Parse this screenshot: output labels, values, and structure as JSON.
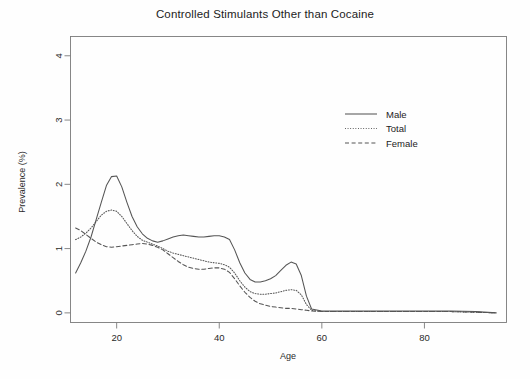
{
  "chart_data": {
    "type": "line",
    "title": "Controlled Stimulants Other than Cocaine",
    "xlabel": "Age",
    "ylabel": "Prevalence (%)",
    "xlim": [
      11,
      96
    ],
    "ylim": [
      -0.15,
      4.3
    ],
    "xticks": [
      20,
      40,
      60,
      80
    ],
    "yticks": [
      0,
      1,
      2,
      3,
      4
    ],
    "grid": false,
    "legend_position": "upper-right-inside",
    "series": [
      {
        "name": "Male",
        "style": "solid",
        "color": "#555555",
        "x": [
          12,
          13,
          14,
          15,
          16,
          17,
          18,
          19,
          20,
          21,
          22,
          23,
          24,
          25,
          26,
          27,
          28,
          29,
          30,
          31,
          32,
          33,
          34,
          35,
          36,
          37,
          38,
          39,
          40,
          41,
          42,
          43,
          44,
          45,
          46,
          47,
          48,
          49,
          50,
          51,
          52,
          53,
          54,
          55,
          56,
          57,
          58,
          60,
          65,
          70,
          75,
          80,
          85,
          90,
          94
        ],
        "values": [
          0.62,
          0.78,
          0.96,
          1.18,
          1.45,
          1.72,
          1.98,
          2.12,
          2.13,
          1.96,
          1.72,
          1.5,
          1.34,
          1.23,
          1.16,
          1.12,
          1.1,
          1.12,
          1.15,
          1.18,
          1.2,
          1.21,
          1.2,
          1.19,
          1.18,
          1.18,
          1.19,
          1.2,
          1.2,
          1.18,
          1.14,
          0.98,
          0.78,
          0.62,
          0.52,
          0.48,
          0.48,
          0.5,
          0.53,
          0.58,
          0.66,
          0.74,
          0.79,
          0.76,
          0.58,
          0.26,
          0.06,
          0.03,
          0.03,
          0.03,
          0.03,
          0.03,
          0.03,
          0.02,
          0.0
        ]
      },
      {
        "name": "Total",
        "style": "dotted",
        "color": "#555555",
        "x": [
          12,
          13,
          14,
          15,
          16,
          17,
          18,
          19,
          20,
          21,
          22,
          23,
          24,
          25,
          26,
          27,
          28,
          29,
          30,
          31,
          32,
          33,
          34,
          35,
          36,
          37,
          38,
          39,
          40,
          41,
          42,
          43,
          44,
          45,
          46,
          47,
          48,
          49,
          50,
          51,
          52,
          53,
          54,
          55,
          56,
          57,
          58,
          60,
          65,
          70,
          75,
          80,
          85,
          90,
          94
        ],
        "values": [
          1.14,
          1.18,
          1.24,
          1.32,
          1.42,
          1.52,
          1.58,
          1.6,
          1.58,
          1.5,
          1.39,
          1.28,
          1.19,
          1.13,
          1.1,
          1.07,
          1.04,
          1.0,
          0.96,
          0.93,
          0.91,
          0.89,
          0.87,
          0.85,
          0.83,
          0.81,
          0.79,
          0.78,
          0.77,
          0.75,
          0.71,
          0.62,
          0.5,
          0.4,
          0.33,
          0.3,
          0.29,
          0.29,
          0.3,
          0.31,
          0.33,
          0.35,
          0.36,
          0.35,
          0.28,
          0.13,
          0.04,
          0.02,
          0.02,
          0.02,
          0.02,
          0.02,
          0.02,
          0.01,
          0.0
        ]
      },
      {
        "name": "Female",
        "style": "dashed",
        "color": "#555555",
        "x": [
          12,
          13,
          14,
          15,
          16,
          17,
          18,
          19,
          20,
          21,
          22,
          23,
          24,
          25,
          26,
          27,
          28,
          29,
          30,
          31,
          32,
          33,
          34,
          35,
          36,
          37,
          38,
          39,
          40,
          41,
          42,
          43,
          44,
          45,
          46,
          47,
          48,
          49,
          50,
          51,
          52,
          53,
          54,
          55,
          56,
          57,
          58,
          60,
          65,
          70,
          75,
          80,
          85,
          90,
          94
        ],
        "values": [
          1.32,
          1.28,
          1.22,
          1.16,
          1.1,
          1.06,
          1.03,
          1.02,
          1.03,
          1.04,
          1.05,
          1.06,
          1.07,
          1.08,
          1.07,
          1.05,
          1.02,
          0.98,
          0.92,
          0.86,
          0.8,
          0.75,
          0.71,
          0.69,
          0.68,
          0.68,
          0.69,
          0.7,
          0.7,
          0.68,
          0.63,
          0.53,
          0.42,
          0.32,
          0.24,
          0.18,
          0.14,
          0.12,
          0.1,
          0.09,
          0.08,
          0.07,
          0.07,
          0.06,
          0.05,
          0.04,
          0.03,
          0.02,
          0.02,
          0.02,
          0.02,
          0.02,
          0.02,
          0.01,
          0.0
        ]
      }
    ],
    "legend_entries": [
      "Male",
      "Total",
      "Female"
    ]
  }
}
